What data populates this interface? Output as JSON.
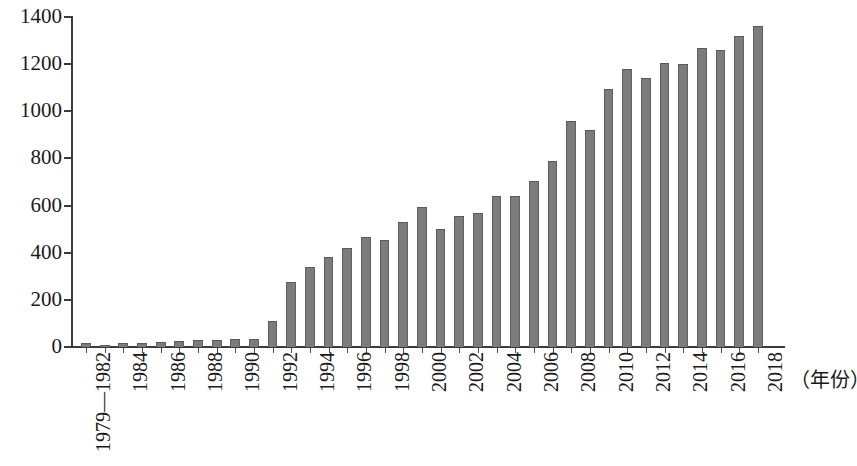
{
  "chart_data": {
    "type": "bar",
    "title": "",
    "subtitle": "",
    "xlabel": "（年份）",
    "ylabel": "",
    "ylim": [
      0,
      1400
    ],
    "ytick_step": 200,
    "yticks": [
      0,
      200,
      400,
      600,
      800,
      1000,
      1200,
      1400
    ],
    "grid": false,
    "legend": null,
    "bar_color": "#7c7c7c",
    "bar_edge_color": "#5f5f5f",
    "axis_color": "#3a3a3a",
    "categories": [
      "1979—1982",
      "1983",
      "1984",
      "1985",
      "1986",
      "1987",
      "1988",
      "1989",
      "1990",
      "1991",
      "1992",
      "1993",
      "1994",
      "1995",
      "1996",
      "1997",
      "1998",
      "1999",
      "2000",
      "2001",
      "2002",
      "2003",
      "2004",
      "2005",
      "2006",
      "2007",
      "2008",
      "2009",
      "2010",
      "2011",
      "2012",
      "2013",
      "2014",
      "2015",
      "2016",
      "2017",
      "2018"
    ],
    "visible_tick_labels": [
      "1979—1982",
      "1984",
      "1986",
      "1988",
      "1990",
      "1992",
      "1994",
      "1996",
      "1998",
      "2000",
      "2002",
      "2004",
      "2006",
      "2008",
      "2010",
      "2012",
      "2014",
      "2016",
      "2018"
    ],
    "values": [
      15,
      8,
      18,
      17,
      22,
      24,
      28,
      28,
      32,
      36,
      110,
      275,
      340,
      380,
      420,
      465,
      455,
      530,
      595,
      500,
      555,
      570,
      640,
      640,
      705,
      790,
      960,
      920,
      1095,
      1180,
      1140,
      1205,
      1200,
      1270,
      1260,
      1320,
      1360
    ]
  },
  "axis": {
    "y_tick_labels": [
      "1400",
      "1200",
      "1000",
      "800",
      "600",
      "400",
      "200",
      "0"
    ],
    "x_caption": "（年份）"
  }
}
